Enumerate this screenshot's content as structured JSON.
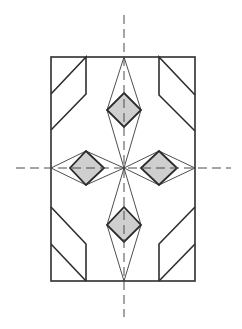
{
  "diagram": {
    "title": "",
    "colors": {
      "background": "#ffffff",
      "line": "#2e2e2e",
      "fill": "#cfcfcf",
      "axis": "#4a4a4a"
    },
    "frame": {
      "x": 51,
      "y": 57,
      "width": 144,
      "height": 224
    },
    "center": {
      "x": 124,
      "y": 168
    },
    "axes": {
      "vertical": {
        "x": 124,
        "y1": 15,
        "y2": 317
      },
      "horizontal": {
        "y": 168,
        "x1": 16,
        "x2": 231
      }
    },
    "corner_bevels": [
      {
        "name": "top-left",
        "points": "51,94 86,57 86,94 51,130"
      },
      {
        "name": "top-right",
        "points": "195,95 159,57 159,95 195,131"
      },
      {
        "name": "bottom-left",
        "points": "51,207 86,244 86,281"
      },
      {
        "name": "bottom-left-inner",
        "points": "51,244 86,281"
      },
      {
        "name": "bottom-right",
        "points": "195,207 159,244 159,281"
      },
      {
        "name": "bottom-right-inner",
        "points": "195,244 159,281"
      }
    ],
    "lenses": [
      {
        "name": "top",
        "points": "124,57 107,110 124,168 141,110"
      },
      {
        "name": "bottom",
        "points": "124,168 107,225 124,281 141,225"
      },
      {
        "name": "left",
        "points": "51,168 86,151 124,168 86,185"
      },
      {
        "name": "right",
        "points": "124,168 159,151 195,168 159,185"
      }
    ],
    "diamonds": [
      {
        "name": "top",
        "points": "124,93 141,110 124,127 107,110"
      },
      {
        "name": "bottom",
        "points": "124,207 141,225 124,242 107,225"
      },
      {
        "name": "left",
        "points": "86,151 104,168 86,185 70,168"
      },
      {
        "name": "right",
        "points": "159,151 177,168 159,185 141,168"
      }
    ]
  }
}
